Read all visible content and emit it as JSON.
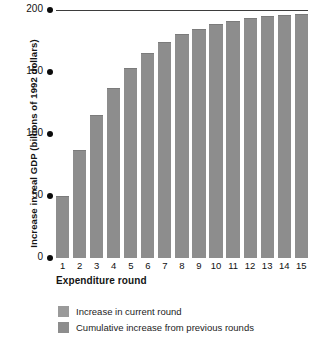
{
  "chart_data": {
    "type": "bar",
    "title": "",
    "xlabel": "Expenditure round",
    "ylabel": "Increase in real GDP (billions of 1992 dollars)",
    "categories": [
      "1",
      "2",
      "3",
      "4",
      "5",
      "6",
      "7",
      "8",
      "9",
      "10",
      "11",
      "12",
      "13",
      "14",
      "15"
    ],
    "values": [
      50,
      87.5,
      115,
      137,
      153,
      165,
      174,
      180.5,
      185,
      189,
      191.5,
      193.5,
      195,
      196,
      197
    ],
    "series": [
      {
        "name": "Cumulative increase in real GDP",
        "values": [
          50,
          87.5,
          115,
          137,
          153,
          165,
          174,
          180.5,
          185,
          189,
          191.5,
          193.5,
          195,
          196,
          197
        ]
      }
    ],
    "ylim": [
      0,
      200
    ],
    "yticks": [
      0,
      50,
      100,
      150,
      200
    ],
    "ytick_labels": [
      "0",
      "50",
      "100",
      "150",
      "200"
    ],
    "grid": false,
    "reference_line": {
      "value": 200,
      "label": ""
    },
    "legend_position": "bottom-left",
    "bar_color": "#8d8d8d",
    "axis_color": "#0b0b0b",
    "legend": [
      "Increase in current round",
      "Cumulative increase from previous rounds"
    ]
  },
  "axes": {
    "y_title": "Increase in real GDP (billions of 1992 dollars)",
    "x_title": "Expenditure round",
    "y_ticks": [
      {
        "label": "200"
      },
      {
        "label": "150"
      },
      {
        "label": "100"
      },
      {
        "label": "50"
      },
      {
        "label": "0"
      }
    ],
    "x_ticks": [
      "1",
      "2",
      "3",
      "4",
      "5",
      "6",
      "7",
      "8",
      "9",
      "10",
      "11",
      "12",
      "13",
      "14",
      "15"
    ]
  },
  "legend": {
    "items": [
      {
        "label": "Increase in current round",
        "color": "#9a9a9a"
      },
      {
        "label": "Cumulative increase from previous rounds",
        "color": "#8d8d8d"
      }
    ]
  }
}
